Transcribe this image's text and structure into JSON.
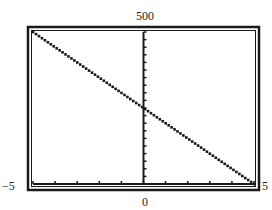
{
  "chart_data": {
    "type": "line",
    "title": "",
    "xlabel": "",
    "ylabel": "",
    "xlim": [
      -5,
      5
    ],
    "ylim": [
      0,
      500
    ],
    "x_tick_step": 1,
    "y_tick_step": 25,
    "grid": false,
    "legend": null,
    "window_labels": {
      "ymax": "500",
      "xmin": "−5",
      "xmax": "5",
      "x_origin": "0"
    },
    "series": [
      {
        "name": "y = 250 - 50x",
        "x": [
          -5,
          0,
          5
        ],
        "y": [
          500,
          250,
          0
        ],
        "style": "dotted-pixel"
      }
    ]
  },
  "colors": {
    "frame": "#1a1a1a",
    "axis": "#1a1a1a",
    "line": "#1a1a1a",
    "background": "#ffffff"
  }
}
